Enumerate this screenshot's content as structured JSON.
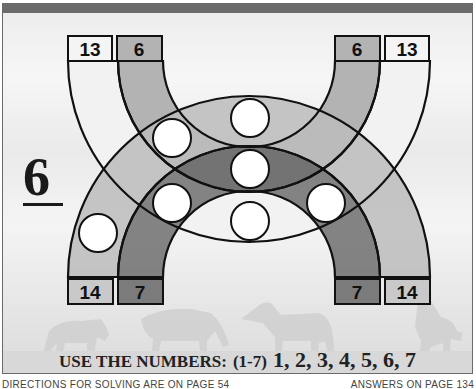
{
  "puzzle": {
    "number": "6",
    "top_labels": {
      "left_outer": "13",
      "left_inner": "6",
      "right_inner": "6",
      "right_outer": "13"
    },
    "bottom_labels": {
      "left_outer": "14",
      "left_inner": "7",
      "right_inner": "7",
      "right_outer": "14"
    },
    "circles": [
      {
        "id": "top-center",
        "value": ""
      },
      {
        "id": "upper-left",
        "value": ""
      },
      {
        "id": "center",
        "value": ""
      },
      {
        "id": "lower-left",
        "value": ""
      },
      {
        "id": "lower-right",
        "value": ""
      },
      {
        "id": "bottom-center",
        "value": ""
      },
      {
        "id": "far-left",
        "value": ""
      }
    ],
    "instructions": {
      "lead": "USE THE NUMBERS:",
      "range": "(1-7)",
      "list": "1, 2, 3, 4, 5, 6, 7"
    }
  },
  "footer": {
    "left": "DIRECTIONS FOR SOLVING ARE ON PAGE 54",
    "right": "ANSWERS ON PAGE 134"
  },
  "colors": {
    "band_13": "#f2f2f2",
    "band_6": "#b3b3b3",
    "band_14": "#c9c9c9",
    "band_7": "#7b7b7b",
    "outline": "#111111",
    "topbar": "#6b6b6b"
  }
}
